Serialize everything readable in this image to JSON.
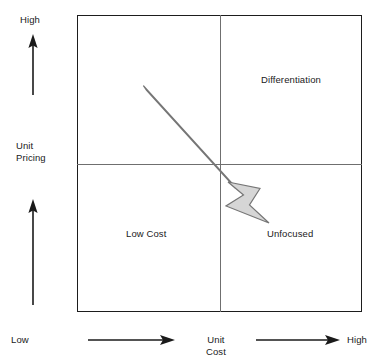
{
  "diagram": {
    "type": "2x2-strategy-matrix",
    "quadrants": [
      {
        "id": "top-left",
        "label": ""
      },
      {
        "id": "top-right",
        "label": "Differentiation"
      },
      {
        "id": "bottom-left",
        "label": "Low Cost"
      },
      {
        "id": "bottom-right",
        "label": "Unfocused"
      }
    ],
    "y_axis": {
      "title_line1": "Unit",
      "title_line2": "Pricing",
      "high_label": "High",
      "direction_icon": "up-arrow"
    },
    "x_axis": {
      "title_line1": "Unit",
      "title_line2": "Cost",
      "low_label": "Low",
      "high_label": "High",
      "direction_icon": "right-arrow"
    },
    "trend_arrow": {
      "icon": "diagonal-down-right-arrow",
      "from": "top-left-quadrant",
      "to": "bottom-right-quadrant"
    },
    "colors": {
      "border": "#1d1d1d",
      "divider": "#6f6f6f",
      "arrow_fill": "#d6d6d6",
      "arrow_stroke": "#767676",
      "text": "#1a1a1a"
    }
  }
}
